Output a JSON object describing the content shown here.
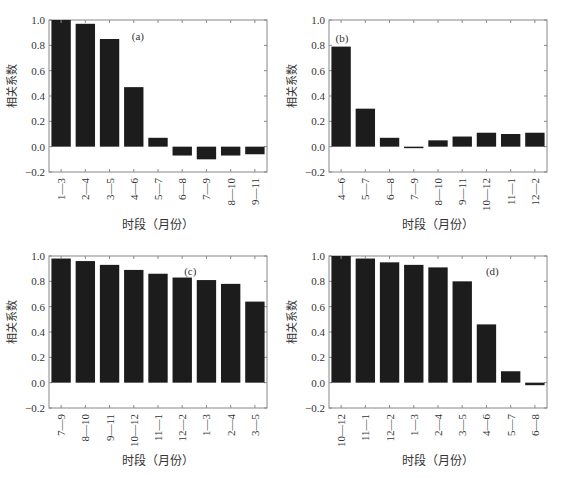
{
  "figure": {
    "ylabel": "相关系数",
    "xlabel": "时段（月份）"
  },
  "chart_data": [
    {
      "type": "bar",
      "panel": "(a)",
      "title": "",
      "xlabel": "时段（月份）",
      "ylabel": "相关系数",
      "ylim": [
        -0.2,
        1.0
      ],
      "yticks": [
        "1.0",
        "0.8",
        "0.6",
        "0.4",
        "0.2",
        "0.0",
        "-0.2"
      ],
      "categories": [
        "1—3",
        "2—4",
        "3—5",
        "4—6",
        "5—7",
        "6—8",
        "7—9",
        "8—10",
        "9—11"
      ],
      "values": [
        1.0,
        0.97,
        0.85,
        0.47,
        0.07,
        -0.07,
        -0.1,
        -0.07,
        -0.06
      ],
      "label_pos": [
        0.38,
        0.08
      ],
      "grid": false
    },
    {
      "type": "bar",
      "panel": "(b)",
      "title": "",
      "xlabel": "时段（月份）",
      "ylabel": "相关系数",
      "ylim": [
        -0.2,
        1.0
      ],
      "yticks": [
        "1.0",
        "0.8",
        "0.6",
        "0.4",
        "0.2",
        "0.0",
        "-0.2"
      ],
      "categories": [
        "4—6",
        "5—7",
        "6—8",
        "7—9",
        "8—10",
        "9—11",
        "10—12",
        "11—1",
        "12—2"
      ],
      "values": [
        0.79,
        0.3,
        0.07,
        -0.01,
        0.05,
        0.08,
        0.11,
        0.1,
        0.11
      ],
      "label_pos": [
        0.03,
        0.09
      ],
      "grid": false
    },
    {
      "type": "bar",
      "panel": "(c)",
      "title": "",
      "xlabel": "时段（月份）",
      "ylabel": "相关系数",
      "ylim": [
        -0.2,
        1.0
      ],
      "yticks": [
        "1.0",
        "0.8",
        "0.6",
        "0.4",
        "0.2",
        "0.0",
        "-0.2"
      ],
      "categories": [
        "7—9",
        "8—10",
        "9—11",
        "10—12",
        "11—1",
        "12—2",
        "1—3",
        "2—4",
        "3—5"
      ],
      "values": [
        0.98,
        0.96,
        0.93,
        0.89,
        0.86,
        0.83,
        0.81,
        0.78,
        0.64
      ],
      "label_pos": [
        0.62,
        0.07
      ],
      "grid": false
    },
    {
      "type": "bar",
      "panel": "(d)",
      "title": "",
      "xlabel": "时段（月份）",
      "ylabel": "相关系数",
      "ylim": [
        -0.2,
        1.0
      ],
      "yticks": [
        "1.0",
        "0.8",
        "0.6",
        "0.4",
        "0.2",
        "0.0",
        "-0.2"
      ],
      "categories": [
        "10—12",
        "11—1",
        "12—2",
        "1—3",
        "2—4",
        "3—5",
        "4—6",
        "5—7",
        "6—8"
      ],
      "values": [
        1.0,
        0.98,
        0.95,
        0.93,
        0.91,
        0.8,
        0.46,
        0.09,
        -0.02
      ],
      "label_pos": [
        0.72,
        0.07
      ],
      "grid": false
    }
  ],
  "style": {
    "bar_color": "#1c1c1c",
    "axis_color": "#888888",
    "text_color": "#333333"
  }
}
